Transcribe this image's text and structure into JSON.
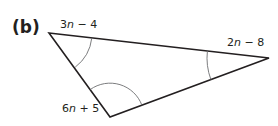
{
  "figure": {
    "part_label": "(b)",
    "shape": "triangle",
    "vertices": {
      "top_left": {
        "x": 49,
        "y": 33,
        "angle_expr": "3n − 4"
      },
      "right": {
        "x": 269,
        "y": 58,
        "angle_expr": "2n − 8"
      },
      "bottom": {
        "x": 110,
        "y": 117,
        "angle_expr": "6n + 5"
      }
    },
    "labels": {
      "top_left": {
        "coef": "3",
        "var": "n",
        "rest": " − 4"
      },
      "right": {
        "coef": "2",
        "var": "n",
        "rest": " − 8"
      },
      "bottom": {
        "coef": "6",
        "var": "n",
        "rest": " + 5"
      }
    },
    "colors": {
      "stroke": "#231f20",
      "arc": "#6d6e71",
      "background": "#ffffff"
    }
  }
}
